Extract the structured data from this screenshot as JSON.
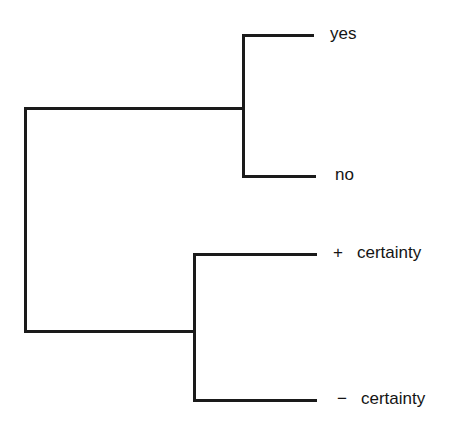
{
  "diagram": {
    "type": "tree",
    "line_color": "#1a1a1a",
    "text_color": "#141414",
    "background": "#ffffff",
    "root": {
      "children": [
        {
          "name": "upper-branch",
          "children": [
            {
              "name": "yes",
              "sign": "",
              "label": "yes"
            },
            {
              "name": "no",
              "sign": "",
              "label": "no"
            }
          ]
        },
        {
          "name": "lower-branch",
          "children": [
            {
              "name": "plus-certainty",
              "sign": "+",
              "label": "certainty"
            },
            {
              "name": "minus-certainty",
              "sign": "−",
              "label": "certainty"
            }
          ]
        }
      ]
    },
    "leaves": {
      "yes": {
        "text": "yes"
      },
      "no": {
        "text": "no"
      },
      "plus_certainty": {
        "sign": "+",
        "text": "certainty"
      },
      "minus_certainty": {
        "sign": "−",
        "text": "certainty"
      }
    }
  }
}
